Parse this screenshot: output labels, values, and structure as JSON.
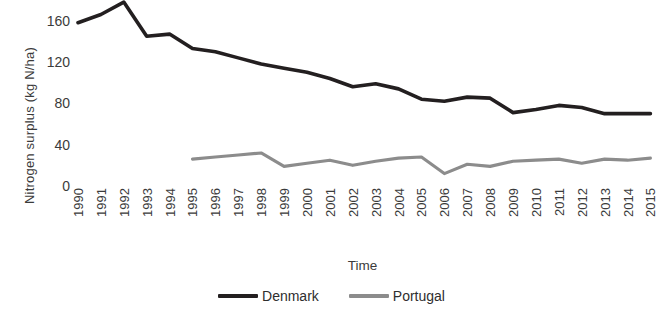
{
  "chart_data": {
    "type": "line",
    "title": "",
    "xlabel": "Time",
    "ylabel": "Nitrogen surplus (kg N/ha)",
    "categories": [
      "1990",
      "1991",
      "1992",
      "1993",
      "1994",
      "1995",
      "1996",
      "1997",
      "1998",
      "1999",
      "2000",
      "2001",
      "2002",
      "2003",
      "2004",
      "2005",
      "2006",
      "2007",
      "2008",
      "2009",
      "2010",
      "2011",
      "2012",
      "2013",
      "2014",
      "2015"
    ],
    "x": [
      1990,
      1991,
      1992,
      1993,
      1994,
      1995,
      1996,
      1997,
      1998,
      1999,
      2000,
      2001,
      2002,
      2003,
      2004,
      2005,
      2006,
      2007,
      2008,
      2009,
      2010,
      2011,
      2012,
      2013,
      2014,
      2015
    ],
    "ylim": [
      0,
      180
    ],
    "yticks": [
      0,
      40,
      80,
      120,
      160
    ],
    "ytick_labels": [
      "0",
      "40",
      "80",
      "120",
      "160"
    ],
    "grid": false,
    "legend_position": "bottom",
    "series": [
      {
        "name": "Denmark",
        "color": "#231f20",
        "values": [
          158,
          166,
          178,
          145,
          147,
          133,
          130,
          124,
          118,
          114,
          110,
          104,
          96,
          99,
          94,
          84,
          82,
          86,
          85,
          71,
          74,
          78,
          76,
          70,
          70,
          70
        ]
      },
      {
        "name": "Portugal",
        "color": "#8c8c8c",
        "values": [
          null,
          null,
          null,
          null,
          null,
          26,
          28,
          30,
          32,
          19,
          22,
          25,
          20,
          24,
          27,
          28,
          12,
          21,
          19,
          24,
          25,
          26,
          22,
          26,
          25,
          27
        ]
      }
    ]
  },
  "legend": {
    "items": [
      {
        "label": "Denmark",
        "color": "#231f20"
      },
      {
        "label": "Portugal",
        "color": "#8c8c8c"
      }
    ]
  }
}
